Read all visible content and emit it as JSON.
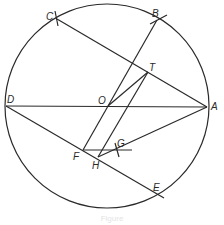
{
  "figure": {
    "type": "geometric-construction",
    "circle": {
      "center": "O",
      "cx": 107,
      "cy": 106,
      "r": 102
    },
    "points": [
      {
        "name": "A",
        "x": 207,
        "y": 107,
        "label_x": 211,
        "label_y": 110
      },
      {
        "name": "B",
        "x": 157,
        "y": 20,
        "label_x": 152,
        "label_y": 17
      },
      {
        "name": "C",
        "x": 57,
        "y": 19,
        "label_x": 46,
        "label_y": 20
      },
      {
        "name": "D",
        "x": 6,
        "y": 106,
        "label_x": 7,
        "label_y": 103
      },
      {
        "name": "E",
        "x": 157,
        "y": 193,
        "label_x": 153,
        "label_y": 191
      },
      {
        "name": "F",
        "x": 83,
        "y": 150,
        "label_x": 73,
        "label_y": 160
      },
      {
        "name": "G",
        "x": 118,
        "y": 150,
        "label_x": 117,
        "label_y": 147
      },
      {
        "name": "H",
        "x": 98,
        "y": 157,
        "label_x": 92,
        "label_y": 169
      },
      {
        "name": "O",
        "x": 108,
        "y": 106,
        "label_x": 98,
        "label_y": 104
      },
      {
        "name": "T",
        "x": 148,
        "y": 72,
        "label_x": 149,
        "label_y": 71
      }
    ],
    "segments": [
      {
        "name": "DA",
        "x1": 6,
        "y1": 106,
        "x2": 207,
        "y2": 107
      },
      {
        "name": "CA",
        "x1": 57,
        "y1": 19,
        "x2": 207,
        "y2": 107
      },
      {
        "name": "FB",
        "x1": 83,
        "y1": 150,
        "x2": 157,
        "y2": 20
      },
      {
        "name": "OT",
        "x1": 108,
        "y1": 106,
        "x2": 148,
        "y2": 72
      },
      {
        "name": "HT",
        "x1": 98,
        "y1": 157,
        "x2": 148,
        "y2": 72
      },
      {
        "name": "DE",
        "x1": 6,
        "y1": 106,
        "x2": 164,
        "y2": 198
      },
      {
        "name": "FG",
        "x1": 83,
        "y1": 150,
        "x2": 132,
        "y2": 150
      },
      {
        "name": "HA",
        "x1": 98,
        "y1": 157,
        "x2": 207,
        "y2": 107
      }
    ],
    "arc_ticks": [
      {
        "at": "C",
        "x1": 55,
        "y1": 11,
        "x2": 58,
        "y2": 26
      },
      {
        "at": "B",
        "x1": 150,
        "y1": 24,
        "x2": 167,
        "y2": 15
      },
      {
        "at": "G",
        "x1": 115,
        "y1": 143,
        "x2": 119,
        "y2": 157
      }
    ],
    "caption": "Figure"
  }
}
